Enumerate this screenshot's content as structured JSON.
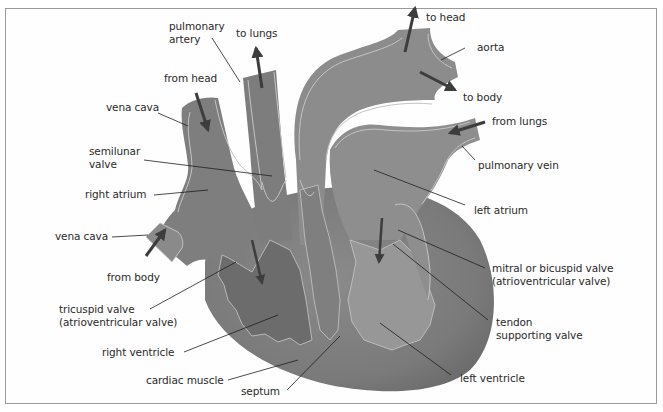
{
  "diagram": {
    "type": "heart-anatomy",
    "colors": {
      "heart_dark": "#6f6f6f",
      "heart_mid": "#858585",
      "heart_light": "#9a9a9a",
      "vessel": "#8c8c8c",
      "outline": "#c4c4c4",
      "arrow": "#3d3d3d",
      "leader": "#1e1e1e",
      "text": "#2a2a2a",
      "border": "#9a9a9a"
    },
    "labels": {
      "pulmonary_artery": [
        "pulmonary",
        "artery"
      ],
      "to_lungs": "to lungs",
      "from_head": "from head",
      "vena_cava_top": "vena cava",
      "semilunar_valve": [
        "semilunar",
        "valve"
      ],
      "right_atrium": "right atrium",
      "vena_cava_bottom": "vena cava",
      "from_body": "from body",
      "tricuspid_valve": [
        "tricuspid valve",
        "(atrioventricular valve)"
      ],
      "right_ventricle": "right ventricle",
      "cardiac_muscle": "cardiac muscle",
      "septum": "septum",
      "to_head": "to head",
      "aorta": "aorta",
      "to_body": "to body",
      "from_lungs": "from lungs",
      "pulmonary_vein": "pulmonary vein",
      "left_atrium": "left atrium",
      "mitral_valve": [
        "mitral or bicuspid valve",
        "(atrioventricular valve)"
      ],
      "tendon": [
        "tendon",
        "supporting valve"
      ],
      "left_ventricle": "left ventricle"
    }
  }
}
